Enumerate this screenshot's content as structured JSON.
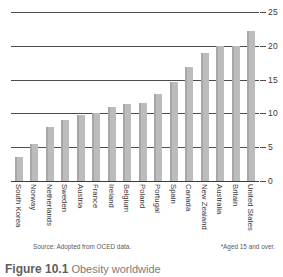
{
  "chart_data": {
    "type": "bar",
    "title": "",
    "xlabel": "",
    "ylabel": "",
    "ylim": [
      0,
      25
    ],
    "yticks": [
      0,
      5,
      10,
      15,
      20,
      25
    ],
    "grid": true,
    "legend": "none",
    "categories": [
      "South Korea",
      "Norway",
      "Netherlands",
      "Sweden",
      "Austria",
      "France",
      "Ireland",
      "Belgium",
      "Poland",
      "Portugal",
      "Spain",
      "Canada",
      "New Zealand",
      "Australia",
      "Britain",
      "United States"
    ],
    "values": [
      3.5,
      5.5,
      8,
      9,
      9.8,
      10,
      11,
      11.4,
      11.5,
      12.8,
      14.6,
      16.9,
      19,
      20,
      20,
      22.2
    ],
    "bar_color": "#bcbcbc",
    "axis_color": "#4b4b4b"
  },
  "axis": {
    "tick_labels": [
      "25",
      "20",
      "15",
      "10",
      "5",
      "0"
    ]
  },
  "notes": {
    "source": "Source: Adopted from OCED data.",
    "footnote": "*Aged 15 and over."
  },
  "caption": {
    "number": "Figure 10.1",
    "text": "Obesity worldwide"
  }
}
